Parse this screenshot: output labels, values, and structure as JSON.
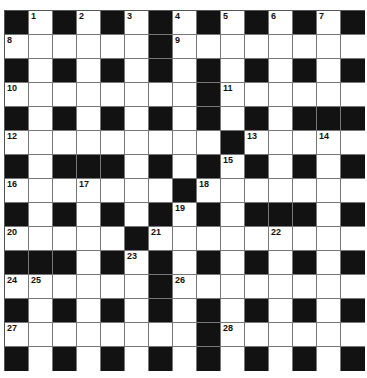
{
  "puzzle": {
    "type": "crossword",
    "size": {
      "rows": 15,
      "cols": 15
    },
    "colors": {
      "black_cell": "#121212",
      "white_cell": "#ffffff",
      "grid_line": "#777777",
      "number": "#111111"
    },
    "rows": [
      "BWBWBWBWBWBWBWB",
      "WWWWWWBWWWWWWWW",
      "BWBWBWBWBWBWBWB",
      "WWWWWWWWBWWWWWW",
      "BWBWBWBWBWBWBBB",
      "WWWWWWWWWBWWWWW",
      "BWBBBWBWBWBWBWB",
      "WWWWWWWBWWWWWWW",
      "BWBWBWBWBWBBBWB",
      "WWWWWBWWWWWWWWW",
      "BBBWBWBWBWBWBWB",
      "WWWWWWBWWWWWWWW",
      "BWBWBWBWBWBWBWB",
      "WWWWWWWWBWWWWWW",
      "BWBWBWBWBWBWBWB"
    ],
    "numbers": [
      {
        "n": "1",
        "r": 0,
        "c": 1
      },
      {
        "n": "2",
        "r": 0,
        "c": 3
      },
      {
        "n": "3",
        "r": 0,
        "c": 5
      },
      {
        "n": "4",
        "r": 0,
        "c": 7
      },
      {
        "n": "5",
        "r": 0,
        "c": 9
      },
      {
        "n": "6",
        "r": 0,
        "c": 11
      },
      {
        "n": "7",
        "r": 0,
        "c": 13
      },
      {
        "n": "8",
        "r": 1,
        "c": 0
      },
      {
        "n": "9",
        "r": 1,
        "c": 7
      },
      {
        "n": "10",
        "r": 3,
        "c": 0
      },
      {
        "n": "11",
        "r": 3,
        "c": 9
      },
      {
        "n": "12",
        "r": 5,
        "c": 0
      },
      {
        "n": "13",
        "r": 5,
        "c": 10
      },
      {
        "n": "14",
        "r": 5,
        "c": 13
      },
      {
        "n": "15",
        "r": 6,
        "c": 9
      },
      {
        "n": "16",
        "r": 7,
        "c": 0
      },
      {
        "n": "17",
        "r": 7,
        "c": 3
      },
      {
        "n": "18",
        "r": 7,
        "c": 8
      },
      {
        "n": "19",
        "r": 8,
        "c": 7
      },
      {
        "n": "20",
        "r": 9,
        "c": 0
      },
      {
        "n": "21",
        "r": 9,
        "c": 6
      },
      {
        "n": "22",
        "r": 9,
        "c": 11
      },
      {
        "n": "23",
        "r": 10,
        "c": 5
      },
      {
        "n": "24",
        "r": 11,
        "c": 0
      },
      {
        "n": "25",
        "r": 11,
        "c": 1
      },
      {
        "n": "26",
        "r": 11,
        "c": 7
      },
      {
        "n": "27",
        "r": 13,
        "c": 0
      },
      {
        "n": "28",
        "r": 13,
        "c": 9
      }
    ]
  }
}
